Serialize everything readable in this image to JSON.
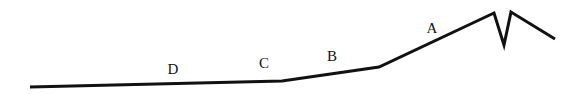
{
  "diagram": {
    "type": "profile-line",
    "stroke_color": "#111111",
    "stroke_width": 3,
    "polyline": [
      [
        30,
        87
      ],
      [
        282,
        81
      ],
      [
        379,
        67
      ],
      [
        494,
        13
      ],
      [
        504,
        45
      ],
      [
        511,
        12
      ],
      [
        555,
        39
      ]
    ],
    "labels": [
      {
        "text": "D",
        "x": 173,
        "y": 69
      },
      {
        "text": "C",
        "x": 264,
        "y": 63
      },
      {
        "text": "B",
        "x": 332,
        "y": 56
      },
      {
        "text": "A",
        "x": 432,
        "y": 28
      }
    ]
  }
}
